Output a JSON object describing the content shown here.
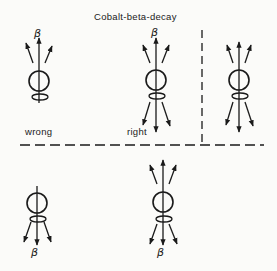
{
  "title": "Cobalt-beta-decay",
  "labels": {
    "wrong": "wrong",
    "right": "right"
  },
  "beta_symbol": "β",
  "colors": {
    "ink": "#1a1a1a",
    "background": "#fbfbf9"
  },
  "figures": [
    {
      "id": "top-left",
      "emission": "up",
      "verdict": "wrong",
      "beta_position": "top"
    },
    {
      "id": "top-middle",
      "emission": "up-and-down",
      "verdict": "right",
      "beta_position": "top"
    },
    {
      "id": "top-right",
      "emission": "up-and-down",
      "verdict": "",
      "beta_position": "none"
    },
    {
      "id": "bottom-left",
      "emission": "down",
      "verdict": "",
      "beta_position": "bottom"
    },
    {
      "id": "bottom-middle",
      "emission": "up-and-down",
      "verdict": "",
      "beta_position": "bottom"
    }
  ]
}
